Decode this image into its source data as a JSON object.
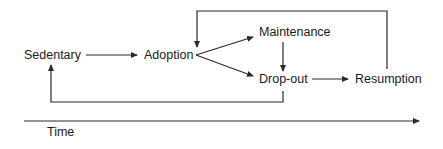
{
  "diagram": {
    "nodes": {
      "sedentary": "Sedentary",
      "adoption": "Adoption",
      "maintenance": "Maintenance",
      "dropout": "Drop-out",
      "resumption": "Resumption"
    },
    "axis": {
      "label": "Time"
    },
    "edges": [
      {
        "from": "Sedentary",
        "to": "Adoption"
      },
      {
        "from": "Adoption",
        "to": "Maintenance"
      },
      {
        "from": "Adoption",
        "to": "Drop-out"
      },
      {
        "from": "Maintenance",
        "to": "Drop-out"
      },
      {
        "from": "Drop-out",
        "to": "Resumption"
      },
      {
        "from": "Resumption",
        "to": "Adoption"
      },
      {
        "from": "Drop-out",
        "to": "Sedentary"
      }
    ],
    "colors": {
      "line": "#2a2a2a",
      "text": "#1a1a1a",
      "background": "#ffffff"
    }
  }
}
